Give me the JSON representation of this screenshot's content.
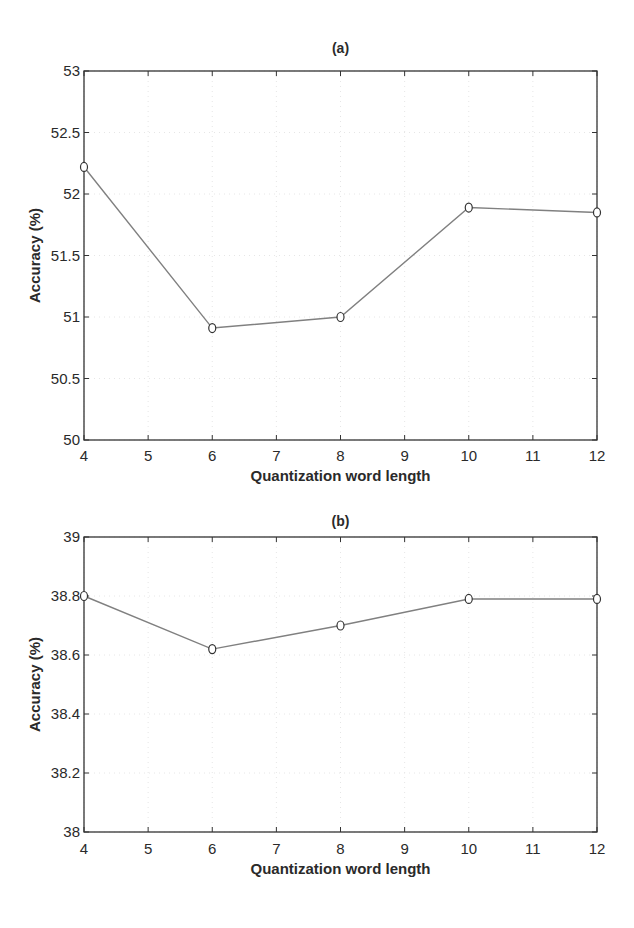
{
  "chart_data": [
    {
      "type": "line",
      "title": "(a)",
      "xlabel": "Quantization word length",
      "ylabel": "Accuracy (%)",
      "xlim": [
        4,
        12
      ],
      "ylim": [
        50,
        53
      ],
      "xticks": [
        "4",
        "5",
        "6",
        "7",
        "8",
        "9",
        "10",
        "11",
        "12"
      ],
      "yticks": [
        "50",
        "50.5",
        "51",
        "51.5",
        "52",
        "52.5",
        "53"
      ],
      "grid": true,
      "series": [
        {
          "name": "Accuracy",
          "x": [
            4,
            6,
            8,
            10,
            12
          ],
          "values": [
            52.22,
            50.91,
            51.0,
            51.89,
            51.85
          ],
          "marker": "circle",
          "color": "#808080"
        }
      ]
    },
    {
      "type": "line",
      "title": "(b)",
      "xlabel": "Quantization word length",
      "ylabel": "Accuracy (%)",
      "xlim": [
        4,
        12
      ],
      "ylim": [
        38,
        39
      ],
      "xticks": [
        "4",
        "5",
        "6",
        "7",
        "8",
        "9",
        "10",
        "11",
        "12"
      ],
      "yticks": [
        "38",
        "38.2",
        "38.4",
        "38.6",
        "38.8",
        "39"
      ],
      "grid": true,
      "series": [
        {
          "name": "Accuracy",
          "x": [
            4,
            6,
            8,
            10,
            12
          ],
          "values": [
            38.8,
            38.62,
            38.7,
            38.79,
            38.79
          ],
          "marker": "circle",
          "color": "#808080"
        }
      ]
    }
  ]
}
